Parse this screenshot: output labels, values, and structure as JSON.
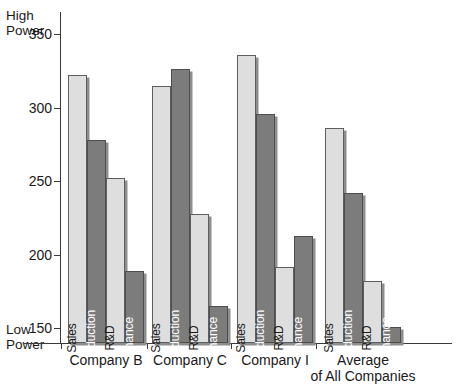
{
  "chart_data": {
    "type": "bar",
    "title": "",
    "subtitle": "",
    "xlabel": "",
    "ylabel": "",
    "ylim": [
      140,
      365
    ],
    "yticks": [
      150,
      200,
      250,
      300,
      350
    ],
    "ytick_labels": [
      "150",
      "200",
      "250",
      "300",
      "350"
    ],
    "axis_top_label": "High\nPower",
    "axis_bottom_label": "Low\nPower",
    "grid": false,
    "legend": "none",
    "categories": [
      "Company B",
      "Company C",
      "Company I",
      "Average\nof All Companies"
    ],
    "series": [
      {
        "name": "Sales",
        "shade": "light",
        "values": [
          322,
          315,
          336,
          286
        ]
      },
      {
        "name": "Production",
        "shade": "dark",
        "values": [
          278,
          326,
          296,
          242
        ]
      },
      {
        "name": "R&D",
        "shade": "light",
        "values": [
          252,
          228,
          192,
          182
        ]
      },
      {
        "name": "Finance",
        "shade": "dark",
        "values": [
          189,
          165,
          213,
          151
        ]
      }
    ],
    "colors": {
      "light_bar": "#dedede",
      "dark_bar": "#7c7c7c",
      "bar_outline": "#5e5e5e",
      "bar_shadow": "#8e8e8e",
      "axis": "#3a3a3a",
      "text": "#1a1a1a",
      "background": "#ffffff"
    }
  },
  "axis": {
    "high_power_line1": "High",
    "high_power_line2": "Power",
    "low_power_line1": "Low",
    "low_power_line2": "Power",
    "ticks": [
      {
        "label": "350"
      },
      {
        "label": "300"
      },
      {
        "label": "250"
      },
      {
        "label": "200"
      },
      {
        "label": "150"
      }
    ]
  },
  "groups": [
    {
      "label": "Company B",
      "label_line1": "Company B",
      "label_line2": "",
      "bars": [
        {
          "name": "Sales",
          "value": 322,
          "shade": "light"
        },
        {
          "name": "Production",
          "value": 278,
          "shade": "dark"
        },
        {
          "name": "R&D",
          "value": 252,
          "shade": "light"
        },
        {
          "name": "Finance",
          "value": 189,
          "shade": "dark"
        }
      ]
    },
    {
      "label": "Company C",
      "label_line1": "Company C",
      "label_line2": "",
      "bars": [
        {
          "name": "Sales",
          "value": 315,
          "shade": "light"
        },
        {
          "name": "Production",
          "value": 326,
          "shade": "dark"
        },
        {
          "name": "R&D",
          "value": 228,
          "shade": "light"
        },
        {
          "name": "Finance",
          "value": 165,
          "shade": "dark"
        }
      ]
    },
    {
      "label": "Company I",
      "label_line1": "Company I",
      "label_line2": "",
      "bars": [
        {
          "name": "Sales",
          "value": 336,
          "shade": "light"
        },
        {
          "name": "Production",
          "value": 296,
          "shade": "dark"
        },
        {
          "name": "R&D",
          "value": 192,
          "shade": "light"
        },
        {
          "name": "Finance",
          "value": 213,
          "shade": "dark"
        }
      ]
    },
    {
      "label": "Average of All Companies",
      "label_line1": "Average",
      "label_line2": "of All Companies",
      "bars": [
        {
          "name": "Sales",
          "value": 286,
          "shade": "light"
        },
        {
          "name": "Production",
          "value": 242,
          "shade": "dark"
        },
        {
          "name": "R&D",
          "value": 182,
          "shade": "light"
        },
        {
          "name": "Finance",
          "value": 151,
          "shade": "dark"
        }
      ]
    }
  ]
}
